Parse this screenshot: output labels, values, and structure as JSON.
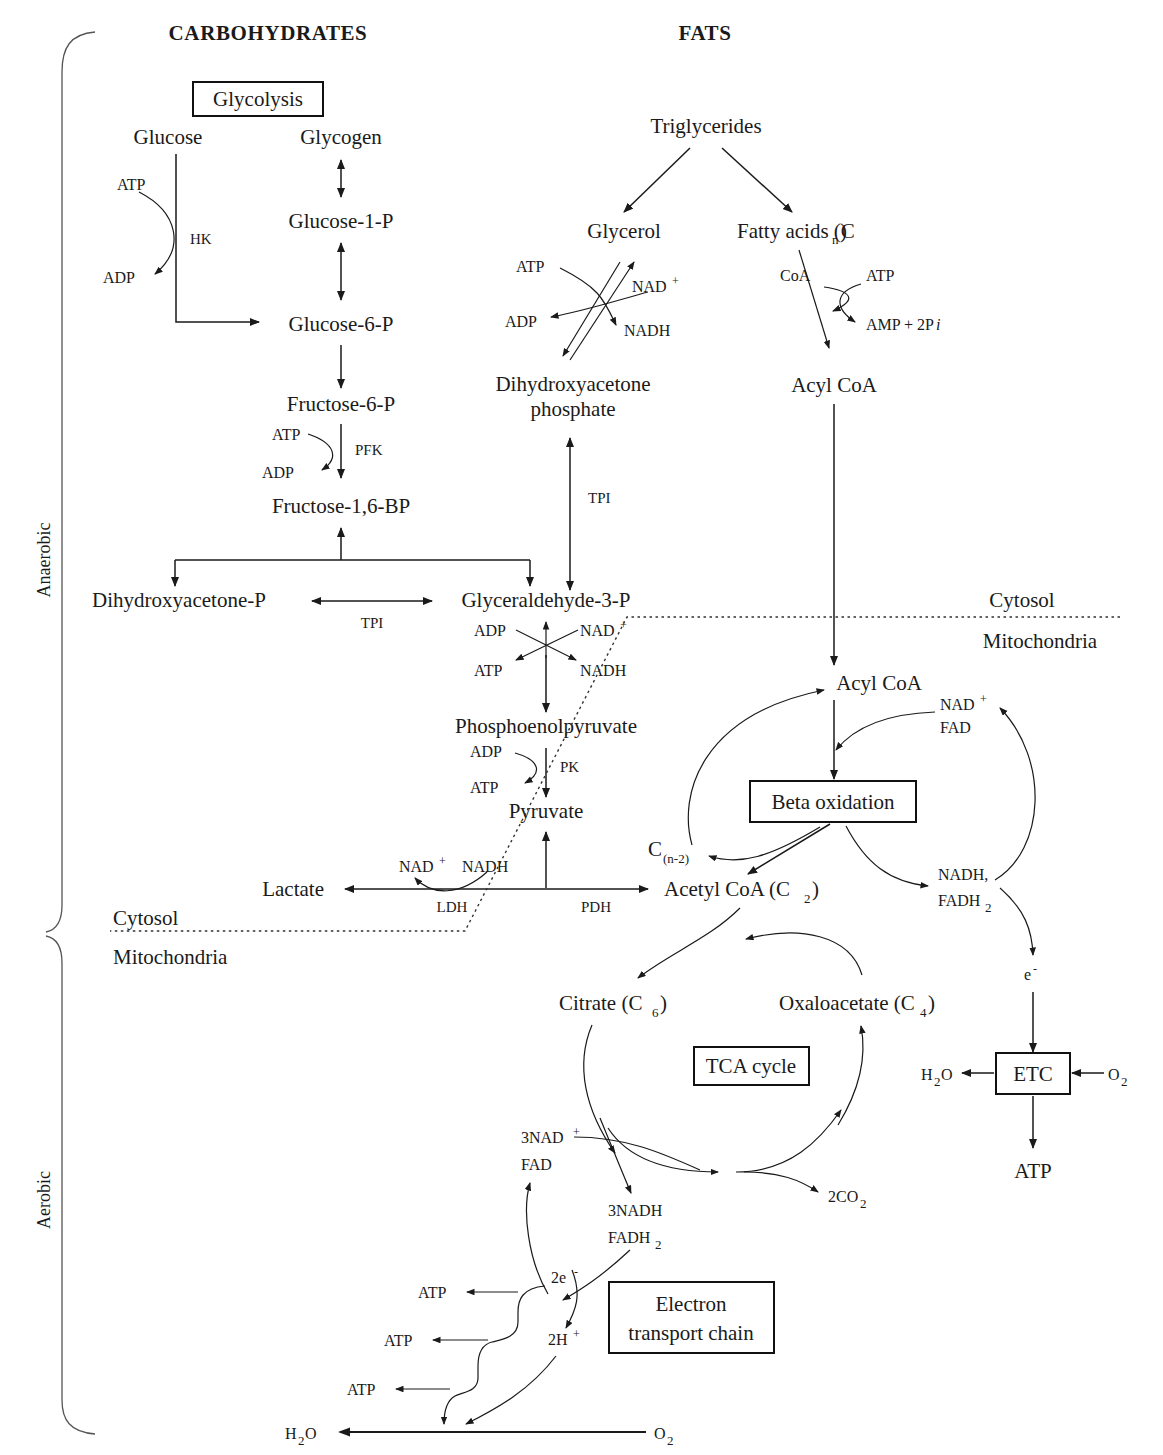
{
  "figure": {
    "headers": {
      "carbohydrates": "CARBOHYDRATES",
      "fats": "FATS"
    },
    "side_labels": {
      "anaerobic": "Anaerobic",
      "aerobic": "Aerobic"
    },
    "compartments": {
      "cytosol_left": "Cytosol",
      "mitochondria_left": "Mitochondria",
      "cytosol_right": "Cytosol",
      "mitochondria_right": "Mitochondria"
    },
    "process_boxes": {
      "glycolysis": "Glycolysis",
      "beta_oxidation": "Beta oxidation",
      "tca_cycle": "TCA cycle",
      "etc": "ETC",
      "electron_transport_chain_l1": "Electron",
      "electron_transport_chain_l2": "transport chain"
    },
    "metabolites": {
      "glucose": "Glucose",
      "glycogen": "Glycogen",
      "glucose_1_p": "Glucose-1-P",
      "glucose_6_p": "Glucose-6-P",
      "fructose_6_p": "Fructose-6-P",
      "fructose_1_6_bp": "Fructose-1,6-BP",
      "dihydroxyacetone_p": "Dihydroxyacetone-P",
      "glyceraldehyde_3_p": "Glyceraldehyde-3-P",
      "phosphoenolpyruvate": "Phosphoenolpyruvate",
      "pyruvate": "Pyruvate",
      "lactate": "Lactate",
      "triglycerides": "Triglycerides",
      "glycerol": "Glycerol",
      "fatty_acids": "Fatty acids (C",
      "fatty_acids_sub": "n",
      "fatty_acids_end": ")",
      "dhap_l1": "Dihydroxyacetone",
      "dhap_l2": "phosphate",
      "acyl_coa_cytosol": "Acyl CoA",
      "acyl_coa_mito": "Acyl CoA",
      "acetyl_coa": "Acetyl CoA (C",
      "acetyl_coa_sub": "2",
      "acetyl_coa_end": ")",
      "c_n_minus_2": "C",
      "c_n_minus_2_sub": "(n-2)",
      "citrate": "Citrate (C",
      "citrate_sub": "6",
      "citrate_end": ")",
      "oxaloacetate": "Oxaloacetate (C",
      "oxaloacetate_sub": "4",
      "oxaloacetate_end": ")"
    },
    "cofactors": {
      "atp": "ATP",
      "adp": "ADP",
      "nad_plus": "NAD",
      "nad_plus_sup": "+",
      "nadh": "NADH",
      "fad": "FAD",
      "fadh2": "FADH",
      "fadh2_sub": "2",
      "coa": "CoA",
      "amp_2pi": "AMP + 2P",
      "amp_2pi_it": "i",
      "nadh_comma": "NADH,",
      "nad_plus_fad_nad": "NAD",
      "nad_plus_fad_fad": "FAD",
      "three_nad": "3NAD",
      "three_nadh": "3NADH",
      "two_co2": "2CO",
      "two_co2_sub": "2",
      "e_minus": "e",
      "e_minus_sup": "-",
      "two_e": "2e",
      "two_e_sup": "-",
      "two_h": "2H",
      "two_h_sup": "+",
      "o2": "O",
      "o2_sub": "2",
      "h2o": "H",
      "h2o_sub": "2",
      "h2o_end": "O"
    },
    "enzymes": {
      "hk": "HK",
      "pfk": "PFK",
      "tpi_glycolysis": "TPI",
      "tpi_glycerol": "TPI",
      "pk": "PK",
      "ldh": "LDH",
      "pdh": "PDH"
    }
  },
  "colors": {
    "ink": "#1a1a1a",
    "rule": "#555555",
    "dashed": "#333333"
  }
}
